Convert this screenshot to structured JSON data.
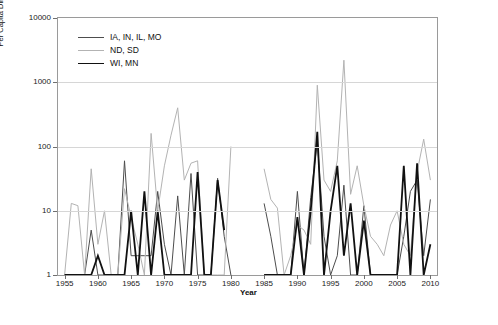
{
  "chart_data": {
    "type": "line",
    "title": "",
    "xlabel": "Year",
    "ylabel": "Per Capita Direct Damage (millions of 1995 $)",
    "xlim": [
      1954,
      2011
    ],
    "ylim": [
      1,
      10000
    ],
    "yscale": "log",
    "grid": true,
    "legend_position": "top-left",
    "xticks": [
      1955,
      1960,
      1965,
      1970,
      1975,
      1980,
      1985,
      1990,
      1995,
      2000,
      2005,
      2010
    ],
    "yticks": [
      1,
      10,
      100,
      1000,
      10000
    ],
    "ytick_labels": [
      "1",
      "10",
      "100",
      "1000",
      "10000"
    ],
    "series": [
      {
        "name": "IA, IN, IL, MO",
        "color": "#4d4d4d",
        "width": 1.0,
        "x": [
          1955,
          1956,
          1957,
          1958,
          1959,
          1960,
          1961,
          1962,
          1963,
          1964,
          1965,
          1966,
          1967,
          1968,
          1969,
          1970,
          1971,
          1972,
          1973,
          1974,
          1975,
          1976,
          1977,
          1978,
          1979,
          1980,
          1981,
          1982,
          1983,
          1984,
          1985,
          1986,
          1987,
          1988,
          1989,
          1990,
          1991,
          1992,
          1993,
          1994,
          1995,
          1996,
          1997,
          1998,
          1999,
          2000,
          2001,
          2002,
          2003,
          2004,
          2005,
          2006,
          2007,
          2008,
          2009,
          2010
        ],
        "values": [
          1,
          1,
          1,
          1,
          5,
          1,
          1,
          1,
          1,
          60,
          2,
          2,
          2,
          2,
          20,
          3,
          1,
          17,
          1,
          38,
          1,
          1,
          1,
          32,
          4,
          1,
          null,
          null,
          null,
          null,
          13,
          4,
          1,
          1,
          1,
          20,
          1,
          16,
          120,
          4,
          1,
          2,
          25,
          1,
          1,
          12,
          1,
          1,
          1,
          1,
          1,
          4,
          20,
          30,
          2,
          15
        ]
      },
      {
        "name": "ND, SD",
        "color": "#b3b3b3",
        "width": 1.0,
        "x": [
          1955,
          1956,
          1957,
          1958,
          1959,
          1960,
          1961,
          1962,
          1963,
          1964,
          1965,
          1966,
          1967,
          1968,
          1969,
          1970,
          1971,
          1972,
          1973,
          1974,
          1975,
          1976,
          1977,
          1978,
          1979,
          1980,
          1981,
          1982,
          1983,
          1984,
          1985,
          1986,
          1987,
          1988,
          1989,
          1990,
          1991,
          1992,
          1993,
          1994,
          1995,
          1996,
          1997,
          1998,
          1999,
          2000,
          2001,
          2002,
          2003,
          2004,
          2005,
          2006,
          2007,
          2008,
          2009,
          2010
        ],
        "values": [
          1,
          13,
          12,
          1,
          45,
          3,
          10,
          1,
          1,
          22,
          8,
          3,
          1,
          160,
          10,
          50,
          150,
          400,
          30,
          55,
          60,
          1,
          1,
          1,
          1,
          100,
          null,
          null,
          null,
          null,
          45,
          15,
          11,
          1,
          2,
          6,
          5,
          3,
          900,
          30,
          20,
          60,
          2200,
          18,
          50,
          12,
          4,
          3,
          2,
          6,
          10,
          3,
          2,
          40,
          130,
          30
        ]
      },
      {
        "name": "WI, MN",
        "color": "#111111",
        "width": 1.8,
        "x": [
          1955,
          1956,
          1957,
          1958,
          1959,
          1960,
          1961,
          1962,
          1963,
          1964,
          1965,
          1966,
          1967,
          1968,
          1969,
          1970,
          1971,
          1972,
          1973,
          1974,
          1975,
          1976,
          1977,
          1978,
          1979,
          1980,
          1981,
          1982,
          1983,
          1984,
          1985,
          1986,
          1987,
          1988,
          1989,
          1990,
          1991,
          1992,
          1993,
          1994,
          1995,
          1996,
          1997,
          1998,
          1999,
          2000,
          2001,
          2002,
          2003,
          2004,
          2005,
          2006,
          2007,
          2008,
          2009,
          2010
        ],
        "values": [
          1,
          1,
          1,
          1,
          1,
          2,
          1,
          1,
          1,
          1,
          10,
          1,
          20,
          1,
          10,
          1,
          1,
          1,
          1,
          1,
          40,
          1,
          1,
          30,
          5,
          null,
          null,
          null,
          null,
          null,
          1,
          1,
          1,
          1,
          1,
          8,
          1,
          10,
          170,
          1,
          10,
          50,
          2,
          13,
          1,
          7,
          1,
          1,
          1,
          1,
          1,
          50,
          1,
          55,
          1,
          3
        ]
      }
    ],
    "legend": [
      {
        "label": "IA, IN, IL, MO",
        "color": "#4d4d4d",
        "width": 1.0
      },
      {
        "label": "ND, SD",
        "color": "#b3b3b3",
        "width": 1.0
      },
      {
        "label": "WI, MN",
        "color": "#111111",
        "width": 1.8
      }
    ]
  }
}
